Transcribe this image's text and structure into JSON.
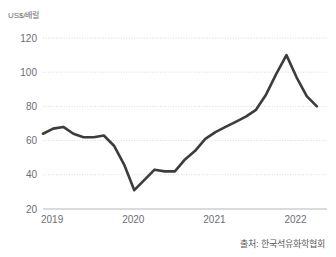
{
  "chart_data": {
    "type": "line",
    "title": "",
    "subtitle": "",
    "xlabel": "",
    "ylabel": "US$/배럴",
    "unit_label": "US$/배럴",
    "source": "출처: 한국석유화학협회",
    "grid": true,
    "legend_position": "none",
    "line_color": "#3c3c3c",
    "grid_color": "#d8dadc",
    "axis_color": "#b5b7b9",
    "tick_text_color": "#6d6e71",
    "ylim": [
      20,
      120
    ],
    "yticks": [
      20,
      40,
      60,
      80,
      100,
      120
    ],
    "ytick_labels": [
      "20",
      "40",
      "60",
      "80",
      "100",
      "120"
    ],
    "xlim": [
      2019.0,
      2022.5
    ],
    "xticks": [
      2019,
      2020,
      2021,
      2022
    ],
    "xtick_labels": [
      "2019",
      "2020",
      "2021",
      "2022"
    ],
    "x": [
      2019.0,
      2019.125,
      2019.25,
      2019.375,
      2019.5,
      2019.625,
      2019.75,
      2019.875,
      2020.0,
      2020.125,
      2020.25,
      2020.375,
      2020.5,
      2020.625,
      2020.75,
      2020.875,
      2021.0,
      2021.125,
      2021.25,
      2021.375,
      2021.5,
      2021.625,
      2021.75,
      2021.875,
      2022.0,
      2022.125,
      2022.25,
      2022.375
    ],
    "values": [
      64,
      67,
      68,
      64,
      62,
      62,
      63,
      57,
      46,
      31,
      37,
      43,
      42,
      42,
      49,
      54,
      61,
      65,
      68,
      71,
      74,
      78,
      87,
      99,
      110,
      97,
      86,
      80
    ],
    "series": [
      {
        "name": "국제 유가",
        "values": [
          64,
          67,
          68,
          64,
          62,
          62,
          63,
          57,
          46,
          31,
          37,
          43,
          42,
          42,
          49,
          54,
          61,
          65,
          68,
          71,
          74,
          78,
          87,
          99,
          110,
          97,
          86,
          80
        ]
      }
    ],
    "annotations": {
      "min_value": 31,
      "max_value": 110,
      "first_value": 64,
      "last_value": 80
    }
  }
}
